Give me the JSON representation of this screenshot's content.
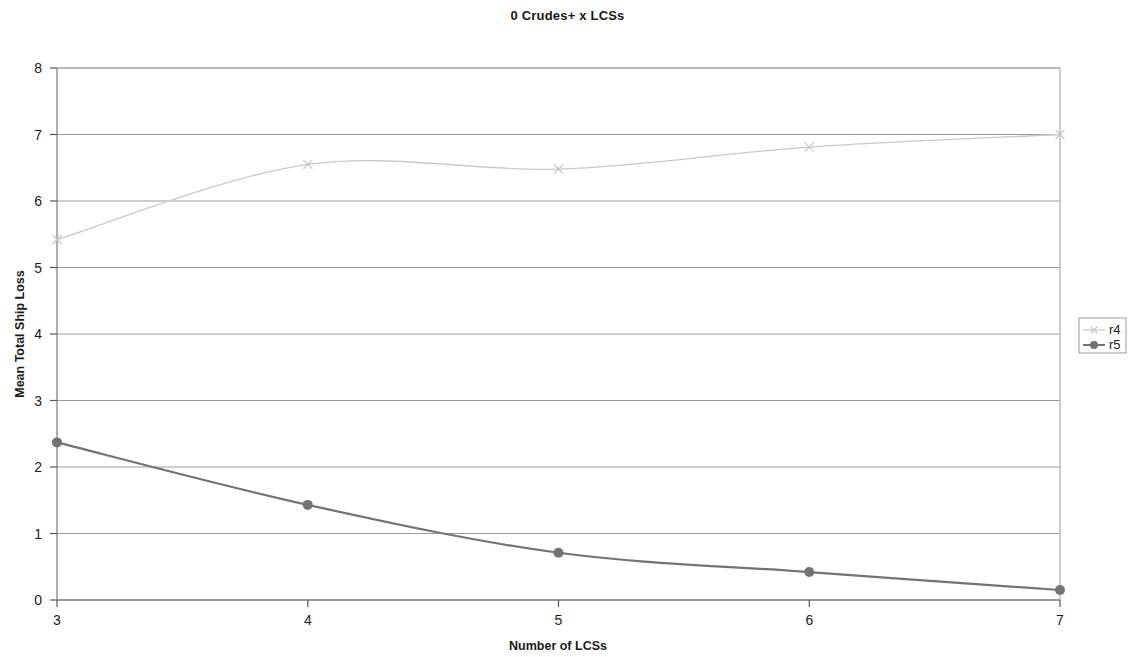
{
  "chart_data": {
    "type": "line",
    "title": "0 Crudes+ x LCSs",
    "xlabel": "Number of LCSs",
    "ylabel": "Mean Total Ship Loss",
    "x": [
      3,
      4,
      5,
      6,
      7
    ],
    "xlim": [
      3,
      7
    ],
    "ylim": [
      0,
      8
    ],
    "xticks": [
      "3",
      "4",
      "5",
      "6",
      "7"
    ],
    "yticks": [
      "0",
      "1",
      "2",
      "3",
      "4",
      "5",
      "6",
      "7",
      "8"
    ],
    "grid": "horizontal",
    "legend_position": "right",
    "series": [
      {
        "name": "r4",
        "values": [
          5.42,
          6.55,
          6.48,
          6.81,
          7.0
        ],
        "color": "#c9c9c9",
        "marker": "x"
      },
      {
        "name": "r5",
        "values": [
          2.37,
          1.43,
          0.71,
          0.42,
          0.15
        ],
        "color": "#737373",
        "marker": "circle"
      }
    ],
    "smoothing": "spline",
    "plot_border_color": "#b0b0b0",
    "gridline_color": "#9a9a9a",
    "axis_color": "#808080"
  },
  "legend": {
    "entries": [
      {
        "label": "r4"
      },
      {
        "label": "r5"
      }
    ]
  }
}
